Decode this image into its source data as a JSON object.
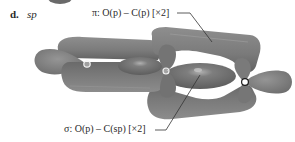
{
  "panel": {
    "letter": "d.",
    "hybridization": "sp"
  },
  "labels": {
    "pi": "π: O(p) – C(p) [×2]",
    "sigma": "σ: O(p) – C(sp) [×2]"
  },
  "atoms": [
    {
      "name": "O",
      "position": "left"
    },
    {
      "name": "C",
      "position": "center"
    },
    {
      "name": "O",
      "position": "right"
    }
  ],
  "colors": {
    "lobe": "#7c7c7c",
    "lobe_dark": "#5e5e5e",
    "lobe_light": "#9a9a9a",
    "text": "#2a2a2a",
    "leader_line": "#333333",
    "atom_fill": "#ffffff"
  }
}
